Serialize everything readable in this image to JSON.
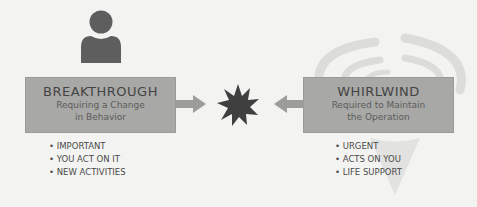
{
  "colors": {
    "background": "#f3f3f1",
    "box_fill": "#a8a8a6",
    "icon_dark": "#5e5e5e",
    "arrow": "#9c9c9a",
    "whirlwind_ghost": "#dcdcda"
  },
  "left": {
    "icon": "person-icon",
    "title": "BREAKTHROUGH",
    "subtitle_line1": "Requiring a Change",
    "subtitle_line2": "in Behavior",
    "bullets": [
      "IMPORTANT",
      "YOU ACT ON IT",
      "NEW ACTIVITIES"
    ]
  },
  "center": {
    "icon": "starburst-icon"
  },
  "right": {
    "icon": "whirlwind-icon",
    "title": "WHIRLWIND",
    "subtitle_line1": "Required to Maintain",
    "subtitle_line2": "the Operation",
    "bullets": [
      "URGENT",
      "ACTS ON YOU",
      "LIFE SUPPORT"
    ]
  }
}
